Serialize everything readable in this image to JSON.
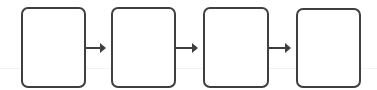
{
  "diagram": {
    "type": "flow",
    "direction": "left-to-right",
    "stroke_color": "#3f3f3f",
    "background": "#ffffff",
    "nodes": [
      {
        "id": "box-1",
        "label": "",
        "x": 21,
        "y": 7,
        "w": 65,
        "h": 81
      },
      {
        "id": "box-2",
        "label": "",
        "x": 111,
        "y": 7,
        "w": 65,
        "h": 81
      },
      {
        "id": "box-3",
        "label": "",
        "x": 203,
        "y": 7,
        "w": 66,
        "h": 81
      },
      {
        "id": "box-4",
        "label": "",
        "x": 296,
        "y": 8,
        "w": 65,
        "h": 80
      }
    ],
    "edges": [
      {
        "from": "box-1",
        "to": "box-2"
      },
      {
        "from": "box-2",
        "to": "box-3"
      },
      {
        "from": "box-3",
        "to": "box-4"
      }
    ]
  }
}
